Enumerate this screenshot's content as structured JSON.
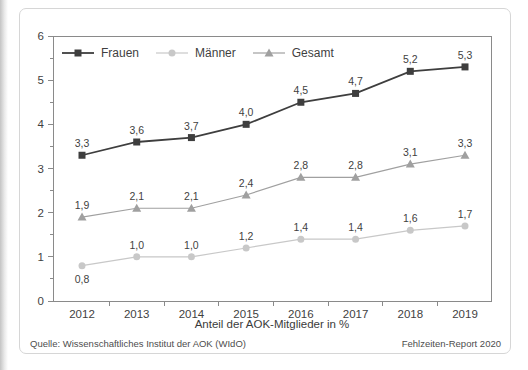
{
  "figure": {
    "source_note": "Quelle: Wissenschaftliches Institut der AOK (WIdO)",
    "report_note": "Fehlzeiten-Report 2020"
  },
  "chart_data": {
    "type": "line",
    "categories": [
      "2012",
      "2013",
      "2014",
      "2015",
      "2016",
      "2017",
      "2018",
      "2019"
    ],
    "series": [
      {
        "name": "Frauen",
        "marker": "square",
        "color": "#3e3e3e",
        "line_width": 1.8,
        "values": [
          3.3,
          3.6,
          3.7,
          4.0,
          4.5,
          4.7,
          5.2,
          5.3
        ],
        "labels": [
          "3,3",
          "3,6",
          "3,7",
          "4,0",
          "4,5",
          "4,7",
          "5,2",
          "5,3"
        ]
      },
      {
        "name": "Männer",
        "marker": "circle",
        "color": "#c8c8c8",
        "line_width": 1.2,
        "values": [
          0.8,
          1.0,
          1.0,
          1.2,
          1.4,
          1.4,
          1.6,
          1.7
        ],
        "labels": [
          "0,8",
          "1,0",
          "1,0",
          "1,2",
          "1,4",
          "1,4",
          "1,6",
          "1,7"
        ],
        "first_label_below": true
      },
      {
        "name": "Gesamt",
        "marker": "triangle",
        "color": "#a0a0a0",
        "line_width": 1.2,
        "values": [
          1.9,
          2.1,
          2.1,
          2.4,
          2.8,
          2.8,
          3.1,
          3.3
        ],
        "labels": [
          "1,9",
          "2,1",
          "2,1",
          "2,4",
          "2,8",
          "2,8",
          "3,1",
          "3,3"
        ]
      }
    ],
    "xlabel": "Anteil der AOK-Mitglieder in %",
    "ylim": [
      0,
      6
    ],
    "yticks": [
      "0",
      "1",
      "2",
      "3",
      "4",
      "5",
      "6"
    ],
    "y_minor_step": 0.5,
    "legend_position": "top-left-inside",
    "grid": false,
    "axis_color": "#8a8a8a",
    "label_color": "#3f3f3f"
  }
}
